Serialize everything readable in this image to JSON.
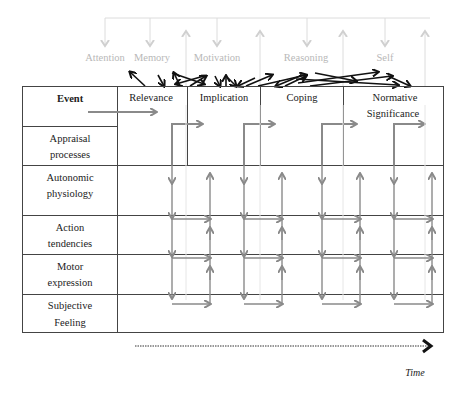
{
  "diagram": {
    "cognitive_functions": [
      "Attention",
      "Memory",
      "Motivation",
      "Reasoning",
      "Self"
    ],
    "stages": [
      "Relevance",
      "Implication",
      "Coping",
      "Normative",
      "Significance"
    ],
    "stage_labels": {
      "relevance": "Relevance",
      "implication": "Implication",
      "coping": "Coping",
      "normative_line1": "Normative",
      "normative_line2": "Significance"
    },
    "rows": {
      "event": "Event",
      "appraisal_1": "Appraisal",
      "appraisal_2": "processes",
      "autonomic_1": "Autonomic",
      "autonomic_2": "physiology",
      "action_1": "Action",
      "action_2": "tendencies",
      "motor_1": "Motor",
      "motor_2": "expression",
      "subjective_1": "Subjective",
      "subjective_2": "Feeling"
    },
    "time_axis_label": "Time",
    "colors": {
      "table_line": "#444444",
      "flow_arrow": "#8a8a8a",
      "faint": "#c8c8c8",
      "interaction_arrow": "#111111"
    }
  }
}
